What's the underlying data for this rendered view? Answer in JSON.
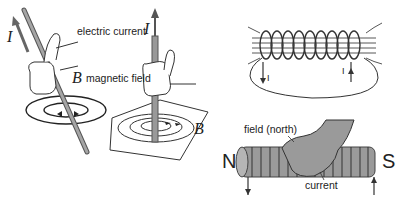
{
  "panel_wire_tilted": {
    "current_symbol": "I",
    "field_symbol": "B"
  },
  "panel_wire_vertical": {
    "current_label": "electric current",
    "current_symbol": "I",
    "field_label": "magnetic field",
    "field_symbol": "B"
  },
  "panel_solenoid_field": {
    "current_in_symbol": "I",
    "current_out_symbol": "I"
  },
  "panel_solenoid_hand": {
    "north_pole": "N",
    "south_pole": "S",
    "field_label": "field (north)",
    "current_label": "current"
  },
  "colors": {
    "rod": "#9a9a9a",
    "rod_edge": "#555555",
    "line": "#333333",
    "hand": "#a0a0a0"
  }
}
